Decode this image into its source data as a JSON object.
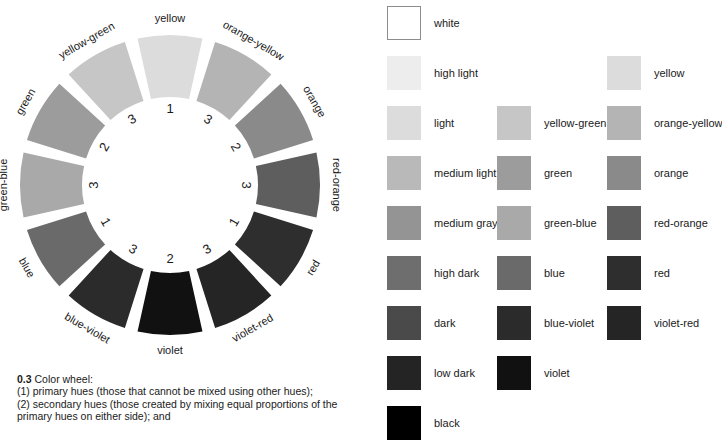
{
  "figure": {
    "caption_number": "0.3",
    "caption_lines": [
      "Color wheel:",
      "(1) primary hues (those that cannot be mixed using other hues);",
      "(2) secondary hues (those created by mixing equal proportions of the",
      "primary hues on either side); and"
    ]
  },
  "wheel": {
    "center_x": 170,
    "center_y": 185,
    "outer_radius": 150,
    "inner_radius": 88,
    "gap_degrees": 5,
    "segments": [
      {
        "label": "yellow",
        "rank": "1",
        "color": "#dcdcdc",
        "mid_angle": -90
      },
      {
        "label": "orange-yellow",
        "rank": "3",
        "color": "#b4b4b4",
        "mid_angle": -60
      },
      {
        "label": "orange",
        "rank": "2",
        "color": "#8a8a8a",
        "mid_angle": -30
      },
      {
        "label": "red-orange",
        "rank": "3",
        "color": "#5e5e5e",
        "mid_angle": 0
      },
      {
        "label": "red",
        "rank": "1",
        "color": "#2e2e2e",
        "mid_angle": 30
      },
      {
        "label": "violet-red",
        "rank": "3",
        "color": "#252525",
        "mid_angle": 60
      },
      {
        "label": "violet",
        "rank": "2",
        "color": "#111111",
        "mid_angle": 90
      },
      {
        "label": "blue-violet",
        "rank": "3",
        "color": "#2b2b2b",
        "mid_angle": 120
      },
      {
        "label": "blue",
        "rank": "1",
        "color": "#6a6a6a",
        "mid_angle": 150
      },
      {
        "label": "green-blue",
        "rank": "3",
        "color": "#a9a9a9",
        "mid_angle": 180
      },
      {
        "label": "green",
        "rank": "2",
        "color": "#9c9c9c",
        "mid_angle": 210
      },
      {
        "label": "yellow-green",
        "rank": "3",
        "color": "#c6c6c6",
        "mid_angle": 240
      }
    ]
  },
  "legend": {
    "columns": [
      {
        "name": "value-scale",
        "items": [
          {
            "label": "white",
            "color": "#ffffff",
            "bordered": true
          },
          {
            "label": "high light",
            "color": "#ededed",
            "bordered": false
          },
          {
            "label": "light",
            "color": "#dcdcdc",
            "bordered": false
          },
          {
            "label": "medium light",
            "color": "#b9b9b9",
            "bordered": false
          },
          {
            "label": "medium gray",
            "color": "#949494",
            "bordered": false
          },
          {
            "label": "high dark",
            "color": "#6e6e6e",
            "bordered": false
          },
          {
            "label": "dark",
            "color": "#4a4a4a",
            "bordered": false
          },
          {
            "label": "low dark",
            "color": "#242424",
            "bordered": false
          },
          {
            "label": "black",
            "color": "#000000",
            "bordered": false
          }
        ]
      },
      {
        "name": "cool-hues",
        "items": [
          {
            "label": "yellow-green",
            "color": "#c6c6c6",
            "bordered": false
          },
          {
            "label": "green",
            "color": "#9c9c9c",
            "bordered": false
          },
          {
            "label": "green-blue",
            "color": "#a9a9a9",
            "bordered": false
          },
          {
            "label": "blue",
            "color": "#6a6a6a",
            "bordered": false
          },
          {
            "label": "blue-violet",
            "color": "#2b2b2b",
            "bordered": false
          },
          {
            "label": "violet",
            "color": "#111111",
            "bordered": false
          }
        ]
      },
      {
        "name": "warm-hues",
        "items": [
          {
            "label": "yellow",
            "color": "#dcdcdc",
            "bordered": false
          },
          {
            "label": "orange-yellow",
            "color": "#b4b4b4",
            "bordered": false
          },
          {
            "label": "orange",
            "color": "#8a8a8a",
            "bordered": false
          },
          {
            "label": "red-orange",
            "color": "#5e5e5e",
            "bordered": false
          },
          {
            "label": "red",
            "color": "#2e2e2e",
            "bordered": false
          },
          {
            "label": "violet-red",
            "color": "#252525",
            "bordered": false
          }
        ]
      }
    ]
  }
}
